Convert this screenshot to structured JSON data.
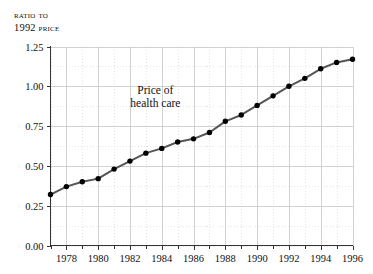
{
  "chart_data": {
    "type": "line",
    "title": "",
    "ylabel_lines": [
      "Ratio to",
      "1992 price"
    ],
    "xlabel": "",
    "annotation": {
      "lines": [
        "Price of",
        "health care"
      ],
      "x": 1983.6,
      "y": 0.95
    },
    "x": [
      1977,
      1978,
      1979,
      1980,
      1981,
      1982,
      1983,
      1984,
      1985,
      1986,
      1987,
      1988,
      1989,
      1990,
      1991,
      1992,
      1993,
      1994,
      1995,
      1996
    ],
    "values": [
      0.32,
      0.37,
      0.4,
      0.42,
      0.48,
      0.53,
      0.58,
      0.61,
      0.65,
      0.67,
      0.71,
      0.78,
      0.82,
      0.88,
      0.94,
      1.0,
      1.05,
      1.11,
      1.15,
      1.17
    ],
    "series": [
      {
        "name": "Price of health care",
        "values": [
          0.32,
          0.37,
          0.4,
          0.42,
          0.48,
          0.53,
          0.58,
          0.61,
          0.65,
          0.67,
          0.71,
          0.78,
          0.82,
          0.88,
          0.94,
          1.0,
          1.05,
          1.11,
          1.15,
          1.17
        ]
      }
    ],
    "ylim": [
      0.0,
      1.25
    ],
    "xlim": [
      1977,
      1996
    ],
    "yticks": [
      0.0,
      0.25,
      0.5,
      0.75,
      1.0,
      1.25
    ],
    "ytick_labels": [
      "0.00",
      "0.25",
      "0.50",
      "0.75",
      "1.00",
      "1.25"
    ],
    "xticks": [
      1977,
      1978,
      1979,
      1980,
      1981,
      1982,
      1983,
      1984,
      1985,
      1986,
      1987,
      1988,
      1989,
      1990,
      1991,
      1992,
      1993,
      1994,
      1995,
      1996
    ],
    "xtick_labels_major": [
      "1978",
      "1980",
      "1982",
      "1984",
      "1986",
      "1988",
      "1990",
      "1992",
      "1994",
      "1996"
    ],
    "xticks_major": [
      1978,
      1980,
      1982,
      1984,
      1986,
      1988,
      1990,
      1992,
      1994,
      1996
    ],
    "grid": {
      "vertical_minor": true,
      "vertical_major": true,
      "horizontal_minor": true,
      "horizontal_major": true
    },
    "legend": "none",
    "colors": {
      "line": "#555555",
      "marker": "#000000",
      "axis": "#333333",
      "grid_major": "#c8c8c8",
      "grid_minor": "#d9d9d9",
      "background": "#ffffff"
    }
  }
}
